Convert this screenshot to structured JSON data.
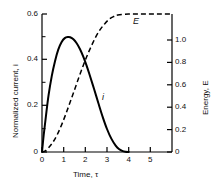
{
  "chart_data": {
    "type": "line",
    "title": "",
    "xlabel": "Time, τ",
    "ylabel": "Normalized current, i",
    "y2label": "Energy, E",
    "xlim": [
      0,
      6
    ],
    "ylim": [
      0,
      0.6
    ],
    "y2lim": [
      0,
      1.0
    ],
    "grid": false,
    "legend": "inline-annotations",
    "xticks": [
      "0",
      "1",
      "2",
      "3",
      "4",
      "5"
    ],
    "xtick_values": [
      0,
      1,
      2,
      3,
      4,
      5
    ],
    "yticks": [
      "0",
      "0.2",
      "0.4",
      "0.6"
    ],
    "ytick_values": [
      0,
      0.2,
      0.4,
      0.6
    ],
    "y2ticks": [
      "0",
      "0.2",
      "0.4",
      "0.6",
      "0.8",
      "1.0"
    ],
    "y2tick_values": [
      0,
      0.2,
      0.4,
      0.6,
      0.8,
      1.0
    ],
    "minor_ticks": true,
    "series": [
      {
        "name": "i",
        "label": "i",
        "axis": "left",
        "style": "solid",
        "color": "#000000",
        "x": [
          0.0,
          0.08,
          0.18,
          0.3,
          0.45,
          0.6,
          0.75,
          0.9,
          1.05,
          1.2,
          1.3,
          1.45,
          1.6,
          1.75,
          1.9,
          2.05,
          2.2,
          2.4,
          2.6,
          2.8,
          3.0,
          3.2,
          3.4,
          3.55,
          3.7,
          3.85,
          4.0
        ],
        "y": [
          0.0,
          0.075,
          0.155,
          0.245,
          0.33,
          0.395,
          0.445,
          0.477,
          0.495,
          0.5,
          0.499,
          0.49,
          0.473,
          0.448,
          0.416,
          0.378,
          0.335,
          0.275,
          0.213,
          0.153,
          0.1,
          0.058,
          0.028,
          0.013,
          0.005,
          0.001,
          0.0
        ]
      },
      {
        "name": "E",
        "label": "E",
        "axis": "right",
        "style": "dashed",
        "color": "#000000",
        "x": [
          0.0,
          0.15,
          0.3,
          0.5,
          0.7,
          0.9,
          1.1,
          1.3,
          1.5,
          1.7,
          1.9,
          2.1,
          2.3,
          2.5,
          2.7,
          2.9,
          3.1,
          3.3,
          3.5,
          4.0,
          4.5,
          5.0,
          5.5,
          6.0
        ],
        "y": [
          0.0,
          0.008,
          0.03,
          0.07,
          0.125,
          0.195,
          0.275,
          0.362,
          0.45,
          0.54,
          0.625,
          0.705,
          0.775,
          0.84,
          0.89,
          0.93,
          0.962,
          0.981,
          0.992,
          1.0,
          1.0,
          1.0,
          1.0,
          1.0
        ]
      }
    ],
    "annotations": [
      {
        "text": "E",
        "x": 4.05,
        "y2": 1.1
      },
      {
        "text": "i",
        "x": 2.78,
        "y": 0.215
      }
    ]
  }
}
